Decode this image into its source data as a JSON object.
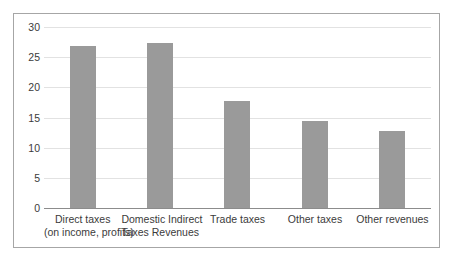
{
  "chart_data": {
    "type": "bar",
    "title": "",
    "subtitle": "",
    "xlabel": "",
    "ylabel": "",
    "ylim": [
      0,
      30
    ],
    "yticks": [
      0,
      5,
      10,
      15,
      20,
      25,
      30
    ],
    "ytick_labels": [
      "0",
      "5",
      "10",
      "15",
      "20",
      "25",
      "30"
    ],
    "grid": true,
    "legend": false,
    "bar_color": "#9a9a9a",
    "gridline_color": "#e2e2e2",
    "axis_color": "#8c8c8c",
    "border_color": "#a6a6a6",
    "categories": [
      "Direct taxes (on income, profits)",
      "Domestic Indirect Taxes Revenues",
      "Trade taxes",
      "Other taxes",
      "Other revenues"
    ],
    "category_lines": [
      [
        "Direct taxes",
        "(on income, profits)"
      ],
      [
        "Domestic Indirect",
        "Taxes Revenues"
      ],
      [
        "Trade taxes",
        ""
      ],
      [
        "Other taxes",
        ""
      ],
      [
        "Other revenues",
        ""
      ]
    ],
    "values": [
      26.8,
      27.4,
      17.8,
      14.5,
      12.7
    ]
  }
}
